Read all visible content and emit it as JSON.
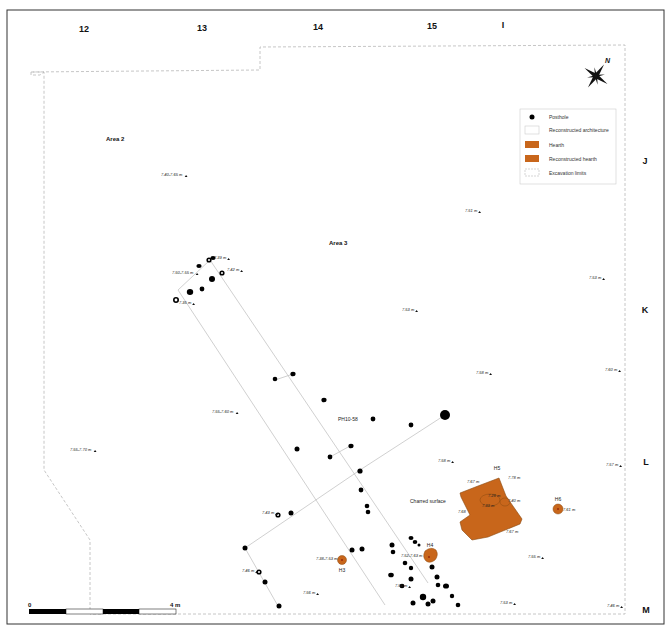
{
  "map": {
    "colors": {
      "hearth": "#c8661b",
      "hearth_edge": "#8a4a10",
      "posthole": "#000000",
      "architecture_line": "#bbbbbb",
      "excavation_line": "#b8b8b8",
      "frame": "#222222"
    },
    "grid_columns": [
      "12",
      "13",
      "14",
      "15"
    ],
    "grid_rows": [
      "I",
      "J",
      "K",
      "L",
      "M"
    ],
    "areas": [
      {
        "label": "Area 2"
      },
      {
        "label": "Area 3"
      }
    ],
    "legend": {
      "items": [
        {
          "symbol": "posthole",
          "label": "Posthole"
        },
        {
          "symbol": "reconstructed-architecture",
          "label": "Reconstructed architecture"
        },
        {
          "symbol": "hearth",
          "label": "Hearth"
        },
        {
          "symbol": "reconstructed-hearth",
          "label": "Reconstructed hearth"
        },
        {
          "symbol": "excavation-limits",
          "label": "Excavation limits"
        }
      ]
    },
    "north_arrow": {
      "label": "N"
    },
    "scale_bar": {
      "start_label": "0",
      "end_label": "4 m",
      "segments": 4
    },
    "feature_labels": {
      "posthole_id": "PH10-58",
      "charred_surface": "Charred surface"
    },
    "hearths": [
      {
        "id": "H3",
        "elevation": "7.38-7.53 m"
      },
      {
        "id": "H4",
        "elevation": "7.52-7.63 m"
      },
      {
        "id": "H5",
        "elevations": [
          "7.67 m",
          "7.78 m",
          "7.68",
          "7.67 m",
          "7.28 m",
          "7.33 m",
          "7.40 m"
        ]
      },
      {
        "id": "H6",
        "elevation": "7.61 m"
      }
    ],
    "elevations": [
      "7.40-7.65 m",
      "7.50-7.55 m",
      "7.39 m",
      "7.42 m",
      "7.35 m",
      "7.51 m",
      "7.53 m",
      "7.53 m",
      "7.58 m",
      "7.60 m",
      "7.55-7.60 m",
      "7.55-7.70 m",
      "7.58 m",
      "7.57 m",
      "7.43 m",
      "7.46 m",
      "7.56 m",
      "7.55 m",
      "7.56 m",
      "7.53 m",
      "7.46 m"
    ]
  }
}
